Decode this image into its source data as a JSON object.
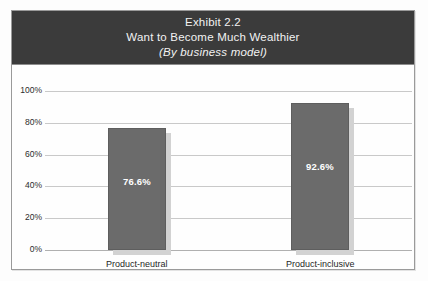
{
  "figure": {
    "exhibit_label": "Exhibit 2.2",
    "title": "Want to Become Much Wealthier",
    "subtitle": "(By business model)"
  },
  "colors": {
    "title_band": "#3b3b3b",
    "bar_fill": "#6b6b6b",
    "bar_shadow": "#d2d2d2",
    "gridline": "#c9c9c9",
    "frame_border": "#9a9a9a",
    "value_label": "#ffffff"
  },
  "chart_data": {
    "type": "bar",
    "title": "Want to Become Much Wealthier",
    "subtitle": "(By business model)",
    "exhibit": "Exhibit 2.2",
    "xlabel": "",
    "ylabel": "",
    "ylim": [
      0,
      100
    ],
    "grid": true,
    "legend": "none",
    "categories": [
      "Product-neutral",
      "Product-inclusive"
    ],
    "values": [
      76.6,
      92.6
    ],
    "value_labels": [
      "76.6%",
      "92.6%"
    ],
    "ytick_labels": [
      "100%",
      "80%",
      "60%",
      "40%",
      "20%",
      "0%"
    ],
    "ytick_values": [
      100,
      80,
      60,
      40,
      20,
      0
    ]
  }
}
